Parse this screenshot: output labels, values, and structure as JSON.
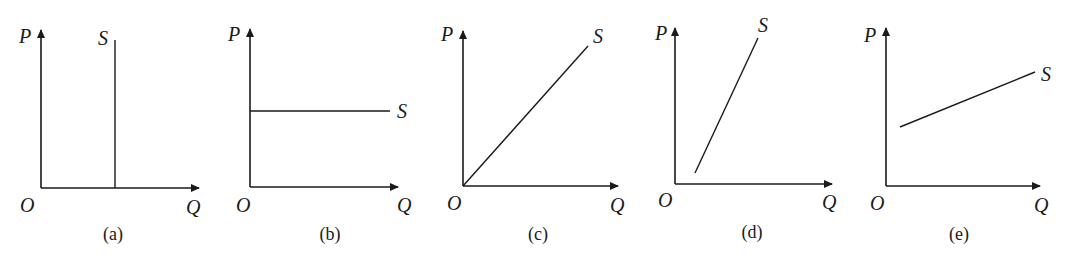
{
  "figure": {
    "panels": [
      {
        "id": "a",
        "caption": "(a)",
        "y_label": "P",
        "x_label": "Q",
        "origin_label": "O",
        "curve_label": "S",
        "curve_type": "vertical"
      },
      {
        "id": "b",
        "caption": "(b)",
        "y_label": "P",
        "x_label": "Q",
        "origin_label": "O",
        "curve_label": "S",
        "curve_type": "horizontal"
      },
      {
        "id": "c",
        "caption": "(c)",
        "y_label": "P",
        "x_label": "Q",
        "origin_label": "O",
        "curve_label": "S",
        "curve_type": "line through origin"
      },
      {
        "id": "d",
        "caption": "(d)",
        "y_label": "P",
        "x_label": "Q",
        "origin_label": "O",
        "curve_label": "S",
        "curve_type": "steep line, positive Q-intercept"
      },
      {
        "id": "e",
        "caption": "(e)",
        "y_label": "P",
        "x_label": "Q",
        "origin_label": "O",
        "curve_label": "S",
        "curve_type": "flat line, positive P-intercept"
      }
    ]
  },
  "colors": {
    "ink": "#1a1a1a",
    "background": "#ffffff"
  }
}
